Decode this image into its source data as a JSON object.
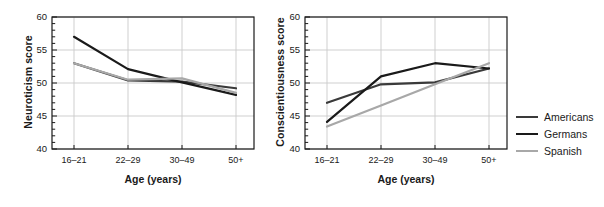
{
  "figure": {
    "panels": [
      {
        "id": "neuroticism",
        "ylabel": "Neuroticism score",
        "xlabel": "Age (years)"
      },
      {
        "id": "conscientiousness",
        "ylabel": "Conscientiousness score",
        "xlabel": "Age (years)"
      }
    ]
  },
  "axis": {
    "yticks": [
      "60",
      "55",
      "50",
      "45",
      "40"
    ],
    "xticks": [
      "16–21",
      "22–29",
      "30–49",
      "50+"
    ]
  },
  "legend": {
    "items": [
      {
        "label": "Americans",
        "color": "#3a3a3a"
      },
      {
        "label": "Germans",
        "color": "#1a1a1a"
      },
      {
        "label": "Spanish",
        "color": "#a8a8a8"
      }
    ]
  },
  "colors": {
    "americans": "#3a3a3a",
    "germans": "#1a1a1a",
    "spanish": "#a8a8a8",
    "axis": "#1a1a1a",
    "grid": "#c9c9c9",
    "text": "#1a1a1a",
    "background": "#ffffff"
  },
  "chart_data": [
    {
      "type": "line",
      "id": "neuroticism",
      "title": "",
      "xlabel": "Age (years)",
      "ylabel": "Neuroticism score",
      "categories": [
        "16–21",
        "22–29",
        "30–49",
        "50+"
      ],
      "ylim": [
        40,
        60
      ],
      "yticks": [
        40,
        45,
        50,
        55,
        60
      ],
      "grid": true,
      "legend_position": "right-outside",
      "series": [
        {
          "name": "Americans",
          "color": "#3a3a3a",
          "values": [
            53.0,
            50.4,
            50.2,
            49.2
          ]
        },
        {
          "name": "Germans",
          "color": "#1a1a1a",
          "values": [
            57.0,
            52.1,
            50.1,
            48.2
          ]
        },
        {
          "name": "Spanish",
          "color": "#a8a8a8",
          "values": [
            53.0,
            50.5,
            50.7,
            48.5
          ]
        }
      ]
    },
    {
      "type": "line",
      "id": "conscientiousness",
      "title": "",
      "xlabel": "Age (years)",
      "ylabel": "Conscientiousness score",
      "categories": [
        "16–21",
        "22–29",
        "30–49",
        "50+"
      ],
      "ylim": [
        40,
        60
      ],
      "yticks": [
        40,
        45,
        50,
        55,
        60
      ],
      "grid": true,
      "legend_position": "right-outside",
      "series": [
        {
          "name": "Americans",
          "color": "#3a3a3a",
          "values": [
            47.0,
            49.8,
            50.1,
            52.2
          ]
        },
        {
          "name": "Germans",
          "color": "#1a1a1a",
          "values": [
            44.1,
            51.0,
            53.0,
            52.2
          ]
        },
        {
          "name": "Spanish",
          "color": "#a8a8a8",
          "values": [
            43.4,
            46.6,
            49.8,
            53.0
          ]
        }
      ]
    }
  ]
}
